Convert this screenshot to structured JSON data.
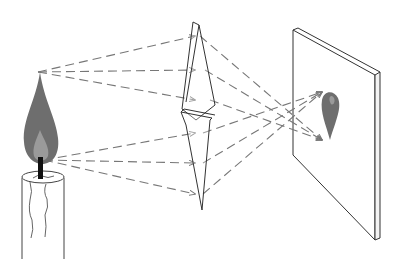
{
  "diagram": {
    "colors": {
      "line": "#333333",
      "ray": "#777777",
      "flame_outer": "#6e6e6e",
      "flame_inner": "#9a9a9a",
      "wick": "#111111",
      "background": "#ffffff"
    },
    "components": [
      {
        "id": "candle",
        "label": "Candle with flame"
      },
      {
        "id": "lens",
        "label": "Converging lens"
      },
      {
        "id": "screen",
        "label": "Screen"
      },
      {
        "id": "image",
        "label": "Inverted flame image"
      }
    ],
    "rays": {
      "from_flame_tip": 3,
      "from_flame_base": 3,
      "style": "dashed with arrowheads"
    }
  }
}
